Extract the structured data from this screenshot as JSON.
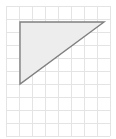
{
  "figure": {
    "canvas": {
      "width": 116,
      "height": 139,
      "background_color": "#ffffff"
    },
    "grid": {
      "label": "square-grid",
      "origin_x": 6,
      "origin_y": 6,
      "cell_size": 13,
      "columns": 8,
      "rows": 10,
      "line_color": "#e4e4e4",
      "line_width": 1,
      "visible": true
    },
    "shape": {
      "name": "right-triangle",
      "type": "polygon",
      "fill_color": "#ededed",
      "stroke_color": "#808080",
      "stroke_width": 1.4,
      "vertices": [
        {
          "label": "top-left",
          "x": 20,
          "y": 22
        },
        {
          "label": "top-right",
          "x": 104,
          "y": 22
        },
        {
          "label": "bottom-left",
          "x": 20,
          "y": 84
        }
      ],
      "points_attr": "20,22 104,22 20,84",
      "legs": {
        "horizontal_length_px": 84,
        "vertical_length_px": 62,
        "horizontal_cells": 6.5,
        "vertical_cells": 4.8
      },
      "right_angle_at": "top-left"
    }
  },
  "chart_data": {
    "type": "scatter",
    "xlabel": "",
    "ylabel": "",
    "series": [
      {
        "name": "right-triangle",
        "x": [
          20,
          104,
          20,
          20
        ],
        "y": [
          22,
          22,
          84,
          22
        ]
      }
    ],
    "xlim": [
      6,
      110
    ],
    "ylim": [
      6,
      136
    ],
    "grid": true,
    "legend": "none"
  }
}
